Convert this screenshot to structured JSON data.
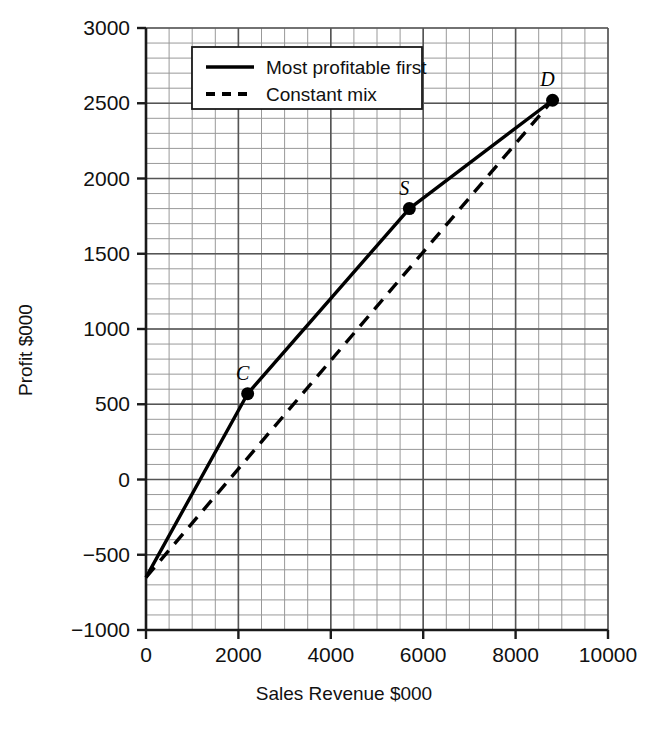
{
  "chart_data": {
    "type": "line",
    "title": "",
    "xlabel": "Sales Revenue $000",
    "ylabel": "Profit $000",
    "xlim": [
      0,
      10000
    ],
    "ylim": [
      -1000,
      3000
    ],
    "x_ticks": [
      "0",
      "2000",
      "4000",
      "6000",
      "8000",
      "10000"
    ],
    "x_tick_values": [
      0,
      2000,
      4000,
      6000,
      8000,
      10000
    ],
    "y_ticks": [
      "3000",
      "2500",
      "2000",
      "1500",
      "1000",
      "500",
      "0",
      "-500",
      "-1000"
    ],
    "y_tick_values": [
      3000,
      2500,
      2000,
      1500,
      1000,
      500,
      0,
      -500,
      -1000
    ],
    "grid": true,
    "grid_minor_x_step": 500,
    "grid_minor_y_step": 100,
    "grid_major_x_step": 2000,
    "grid_major_y_step": 500,
    "legend_position": "top-center",
    "series": [
      {
        "name": "Most profitable first",
        "style": "solid",
        "color": "#000000",
        "points": [
          {
            "x": 0,
            "y": -650,
            "label": ""
          },
          {
            "x": 2200,
            "y": 570,
            "label": "C"
          },
          {
            "x": 5700,
            "y": 1800,
            "label": "S"
          },
          {
            "x": 8800,
            "y": 2520,
            "label": "D"
          }
        ]
      },
      {
        "name": "Constant mix",
        "style": "dashed",
        "color": "#000000",
        "points": [
          {
            "x": 0,
            "y": -650
          },
          {
            "x": 8800,
            "y": 2520
          }
        ]
      }
    ],
    "point_markers": [
      {
        "label": "C",
        "x": 2200,
        "y": 570
      },
      {
        "label": "S",
        "x": 5700,
        "y": 1800
      },
      {
        "label": "D",
        "x": 8800,
        "y": 2520
      }
    ]
  },
  "legend": {
    "entries": [
      {
        "label": "Most profitable first",
        "style": "solid"
      },
      {
        "label": "Constant mix",
        "style": "dashed"
      }
    ]
  },
  "colors": {
    "axis": "#1a1a1a",
    "grid_major": "#555555",
    "grid_minor": "#999999",
    "series": "#000000",
    "background": "#ffffff"
  }
}
